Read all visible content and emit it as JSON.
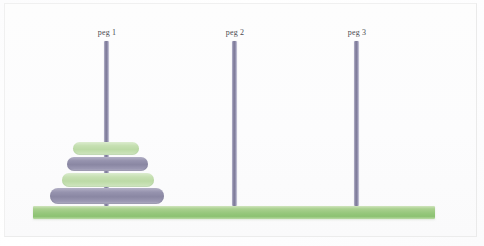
{
  "app": {
    "title": "Towers of Hanoi",
    "background_color": "#fdfdfd"
  },
  "board": {
    "base": {
      "name": "base-bar",
      "color": "#a9d08e",
      "x": 33,
      "y": 206,
      "width": 402,
      "height": 13
    },
    "peg_color": "#8e8ba8",
    "peg_width": 5,
    "peg_top_y": 41,
    "peg_bottom_y": 206
  },
  "pegs": [
    {
      "id": "peg-1",
      "label": "peg 1",
      "center_x": 106,
      "label_x": 107,
      "label_y": 28,
      "disk_count": 4
    },
    {
      "id": "peg-2",
      "label": "peg 2",
      "center_x": 234,
      "label_x": 235,
      "label_y": 28,
      "disk_count": 0
    },
    {
      "id": "peg-3",
      "label": "peg 3",
      "center_x": 356,
      "label_x": 357,
      "label_y": 28,
      "disk_count": 0
    }
  ],
  "disks": [
    {
      "id": "disk-1",
      "size": 1,
      "peg": "peg-1",
      "stack_position": 4,
      "color_name": "green",
      "color": "#c6e0b2",
      "x": 73,
      "y": 142,
      "width": 66,
      "height": 13
    },
    {
      "id": "disk-2",
      "size": 2,
      "peg": "peg-1",
      "stack_position": 3,
      "color_name": "purple",
      "color": "#9693ae",
      "x": 67,
      "y": 157,
      "width": 81,
      "height": 14
    },
    {
      "id": "disk-3",
      "size": 3,
      "peg": "peg-1",
      "stack_position": 2,
      "color_name": "green",
      "color": "#c6e0b2",
      "x": 62,
      "y": 173,
      "width": 92,
      "height": 14
    },
    {
      "id": "disk-4",
      "size": 4,
      "peg": "peg-1",
      "stack_position": 1,
      "color_name": "purple",
      "color": "#9693ae",
      "x": 50,
      "y": 188,
      "width": 114,
      "height": 16
    }
  ]
}
